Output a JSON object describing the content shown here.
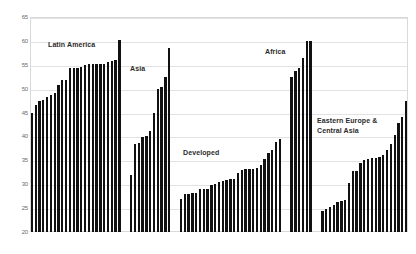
{
  "chart_data": {
    "type": "bar",
    "title": "",
    "xlabel": "",
    "ylabel": "",
    "ylim": [
      20,
      65
    ],
    "yticks": [
      20,
      25,
      30,
      35,
      40,
      45,
      50,
      55,
      60,
      65
    ],
    "ytick_labels": [
      "20",
      "25",
      "30",
      "35",
      "40",
      "45",
      "50",
      "55",
      "60",
      "65"
    ],
    "grid": true,
    "legend": "none",
    "bar_color": "#111111",
    "grid_color": "#e2e2e2",
    "border_color": "#d9d9d9",
    "background_color": "#ffffff",
    "label_color": "#2b2b2b",
    "tick_color": "#6b6b6b",
    "groups": [
      {
        "name": "Latin America",
        "label": "Latin America",
        "label_x": 48,
        "label_y": 40,
        "values": [
          45.0,
          46.6,
          47.4,
          47.6,
          48.3,
          48.6,
          49.2,
          50.8,
          51.8,
          51.9,
          54.3,
          54.4,
          54.4,
          54.6,
          55.0,
          55.1,
          55.1,
          55.1,
          55.1,
          55.2,
          55.6,
          55.8,
          56.1,
          60.2
        ]
      },
      {
        "name": "Asia",
        "label": "Asia",
        "label_x": 130,
        "label_y": 64,
        "values": [
          31.9,
          38.5,
          38.7,
          39.8,
          40.0,
          41.2,
          44.9,
          49.9,
          50.4,
          52.5,
          58.6
        ]
      },
      {
        "name": "Developed",
        "label": "Developed",
        "label_x": 183,
        "label_y": 148,
        "values": [
          27.0,
          27.9,
          28.0,
          28.1,
          28.2,
          28.9,
          28.9,
          28.9,
          29.9,
          30.0,
          30.4,
          30.6,
          30.8,
          31.0,
          31.2,
          32.4,
          33.0,
          33.1,
          33.1,
          33.2,
          33.5,
          34.0,
          35.2,
          36.6,
          37.1,
          38.9,
          39.4
        ]
      },
      {
        "name": "Africa",
        "label": "Africa",
        "label_x": 265,
        "label_y": 47,
        "values": [
          52.5,
          53.6,
          54.4,
          56.4,
          59.9,
          60.0
        ]
      },
      {
        "name": "Eastern Europe & Central Asia",
        "label": "Eastern Europe &\nCentral Asia",
        "label_x": 317,
        "label_y": 116,
        "values": [
          24.4,
          24.9,
          25.2,
          25.6,
          26.3,
          26.5,
          26.8,
          30.3,
          32.8,
          32.8,
          34.5,
          35.1,
          35.2,
          35.4,
          35.5,
          35.6,
          36.2,
          37.1,
          38.4,
          40.4,
          42.8,
          44.1,
          47.5
        ]
      }
    ]
  }
}
